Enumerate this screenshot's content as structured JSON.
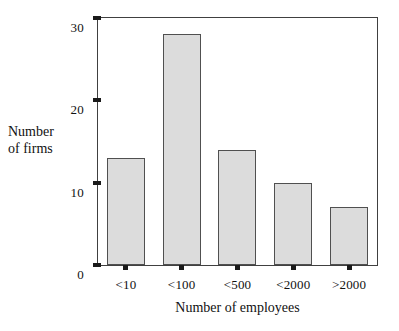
{
  "chart_data": {
    "type": "bar",
    "title": "",
    "subtitle": "",
    "categories": [
      "<10",
      "<100",
      "<500",
      "<2000",
      ">2000"
    ],
    "values": [
      13,
      28,
      14,
      10,
      7
    ],
    "xlabel": "Number of employees",
    "ylabel_lines": [
      "Number",
      "of firms"
    ],
    "ylabel": "Number of firms",
    "ylim": [
      0,
      30
    ],
    "yticks": [
      0,
      10,
      20,
      30
    ],
    "ytick_labels": [
      "0",
      "10",
      "20",
      "30"
    ],
    "grid": false,
    "legend": false,
    "legend_position": "none",
    "bar_fill_color": "#dcdcdc",
    "bar_edge_color": "#505050",
    "axis_color": "#404040",
    "background_color": "#ffffff",
    "text_color": "#111111"
  },
  "axes": {
    "y_title_line1": "Number",
    "y_title_line2": "of firms",
    "x_title": "Number of employees"
  },
  "ticks": {
    "y": [
      {
        "label": "30",
        "value": 30
      },
      {
        "label": "20",
        "value": 20
      },
      {
        "label": "10",
        "value": 10
      },
      {
        "label": "0",
        "value": 0
      }
    ],
    "x": [
      {
        "label": "<10"
      },
      {
        "label": "<100"
      },
      {
        "label": "<500"
      },
      {
        "label": "<2000"
      },
      {
        "label": ">2000"
      }
    ]
  }
}
